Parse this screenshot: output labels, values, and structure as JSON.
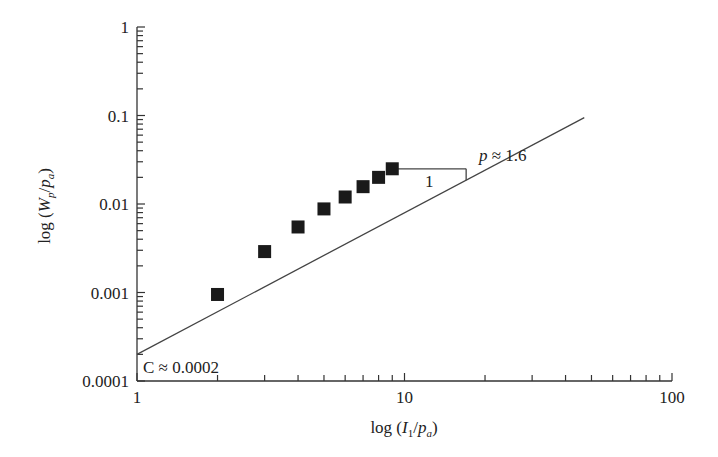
{
  "chart_data": {
    "type": "scatter",
    "title": "",
    "xlabel": "log (I1/pa)",
    "ylabel": "log (Wp/pa)",
    "xlabel_parts": {
      "pre": "log (",
      "var": "I",
      "sub": "1",
      "mid": "/",
      "var2": "p",
      "sub2": "a",
      "post": ")"
    },
    "ylabel_parts": {
      "pre": "log (",
      "var": "W",
      "sub": "p",
      "mid": "/",
      "var2": "p",
      "sub2": "a",
      "post": ")"
    },
    "xscale": "log",
    "yscale": "log",
    "xlim": [
      1,
      100
    ],
    "ylim": [
      0.0001,
      1
    ],
    "x_ticks": [
      1,
      10,
      100
    ],
    "x_tick_labels": [
      "1",
      "10",
      "100"
    ],
    "y_ticks": [
      0.0001,
      0.001,
      0.01,
      0.1,
      1
    ],
    "y_tick_labels": [
      "0.0001",
      "0.001",
      "0.01",
      "0.1",
      "1"
    ],
    "grid": false,
    "legend": null,
    "series": [
      {
        "name": "data",
        "marker": "square",
        "color": "#1a1a1a",
        "x": [
          2,
          3,
          4,
          5,
          6,
          7,
          8,
          9
        ],
        "y": [
          0.00095,
          0.0029,
          0.0055,
          0.0088,
          0.012,
          0.0157,
          0.02,
          0.025
        ]
      },
      {
        "name": "fit",
        "type": "line",
        "color": "#444444",
        "equation": "W/pa = C * (I1/pa)^p",
        "C": 0.0002,
        "p": 1.6,
        "x_range": [
          1,
          47
        ]
      }
    ],
    "annotations": [
      {
        "text": "C ≈ 0.0002",
        "position": "lower-left, at y-intercept"
      },
      {
        "text": "p ≈ 1.6",
        "position": "right of slope triangle"
      },
      {
        "text": "1",
        "position": "below slope triangle base"
      }
    ],
    "slope_triangle": {
      "x_start": 9,
      "x_end": 17,
      "y_base": 0.025
    }
  },
  "labels": {
    "c_annotation": "C ≈ 0.0002",
    "p_annotation_var": "p",
    "p_annotation_rest": " ≈ 1.6",
    "run_label": "1"
  }
}
